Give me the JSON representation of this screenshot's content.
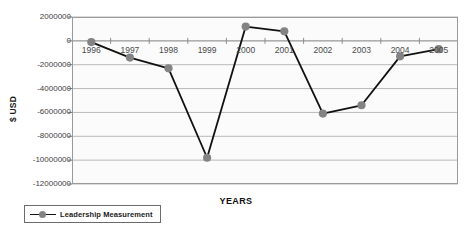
{
  "chart_data": {
    "type": "line",
    "title": "",
    "xlabel": "YEARS",
    "ylabel": "$ USD",
    "categories": [
      "1996",
      "1997",
      "1998",
      "1999",
      "2000",
      "2001",
      "2002",
      "2003",
      "2004",
      "2005"
    ],
    "series": [
      {
        "name": "Leadership Measurement",
        "values": [
          -100000,
          -1400000,
          -2300000,
          -9800000,
          1200000,
          800000,
          -6100000,
          -5400000,
          -1300000,
          -700000
        ]
      }
    ],
    "ylim": [
      -12000000,
      2000000
    ],
    "y_ticks": [
      2000000,
      0,
      -2000000,
      -4000000,
      -6000000,
      -8000000,
      -10000000,
      -12000000
    ],
    "y_tick_labels": [
      "2000000",
      "0",
      "-2000000",
      "-4000000",
      "-6000000",
      "-8000000",
      "-10000000",
      "-12000000"
    ],
    "grid": true,
    "legend_position": "bottom-left",
    "colors": {
      "line": "#111111",
      "marker": "#838383",
      "gridline": "#b9b9b9",
      "plot_border": "#9a9a9a",
      "plot_background": "#fbfbfb"
    }
  },
  "legend": {
    "entries": [
      {
        "label": "Leadership Measurement"
      }
    ]
  },
  "axes": {
    "y_title": "$ USD",
    "x_title": "YEARS"
  }
}
